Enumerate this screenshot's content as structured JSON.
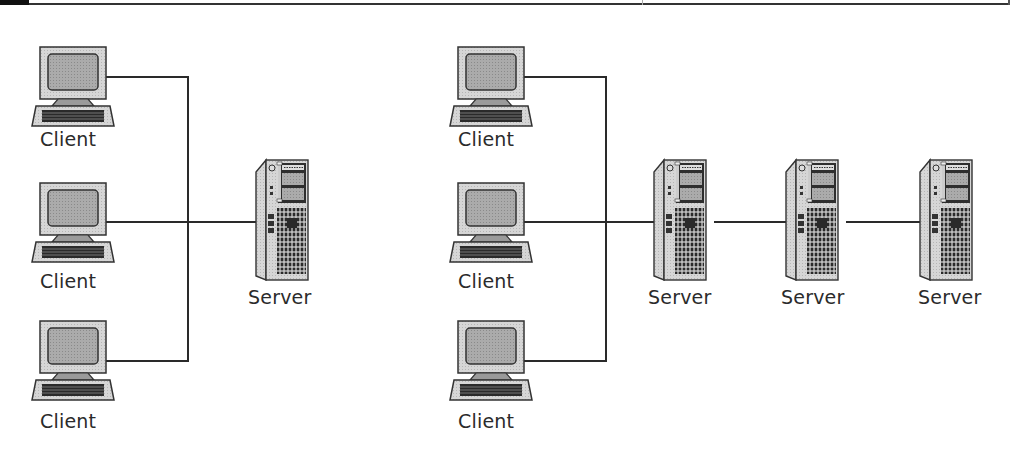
{
  "diagram": {
    "type": "network-topology",
    "panels": [
      {
        "name": "single-server",
        "clients": [
          {
            "label": "Client"
          },
          {
            "label": "Client"
          },
          {
            "label": "Client"
          }
        ],
        "servers": [
          {
            "label": "Server"
          }
        ]
      },
      {
        "name": "multi-server",
        "clients": [
          {
            "label": "Client"
          },
          {
            "label": "Client"
          },
          {
            "label": "Client"
          }
        ],
        "servers": [
          {
            "label": "Server"
          },
          {
            "label": "Server"
          },
          {
            "label": "Server"
          }
        ]
      }
    ],
    "colors": {
      "line": "#2a2a2a",
      "device_body": "#d4d4d4",
      "screen": "#a8a8a8",
      "server_grid": "#3a3a3a"
    }
  }
}
